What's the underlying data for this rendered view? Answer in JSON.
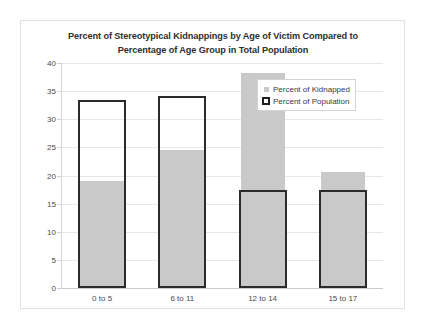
{
  "chart_data": {
    "type": "bar",
    "title": "Percent of Stereotypical Kidnappings by Age of Victim Compared to Percentage of Age Group in Total Population",
    "title_lines": [
      "Percent of Stereotypical Kidnappings by Age of Victim Compared to",
      "Percentage of Age Group in Total Population"
    ],
    "xlabel": "",
    "ylabel": "",
    "ylim": [
      0,
      40
    ],
    "ytick_step": 5,
    "yticks": [
      40,
      35,
      30,
      25,
      20,
      15,
      10,
      5,
      0
    ],
    "ytick_labels": [
      "40",
      "35",
      "30",
      "25",
      "20",
      "15",
      "10",
      "5",
      "0"
    ],
    "grid": true,
    "legend_position": "upper-right-inside",
    "categories": [
      "0 to 5",
      "6 to 11",
      "12 to 14",
      "15 to 17"
    ],
    "series": [
      {
        "name": "Percent of Kidnapped",
        "style": "filled",
        "color": "#c9c9c9",
        "values": [
          19.0,
          24.5,
          38.2,
          20.6
        ]
      },
      {
        "name": "Percent of Population",
        "style": "outline",
        "color": "#2b2b2b",
        "values": [
          33.4,
          34.1,
          17.4,
          17.4
        ]
      }
    ]
  },
  "colors": {
    "kidnapped_fill": "#c9c9c9",
    "population_outline": "#2b2b2b",
    "gridline": "#e6e6e6",
    "frame_border": "#e2e2e2",
    "axis_text": "#4a4a4a",
    "title_text": "#2f2f2f"
  }
}
